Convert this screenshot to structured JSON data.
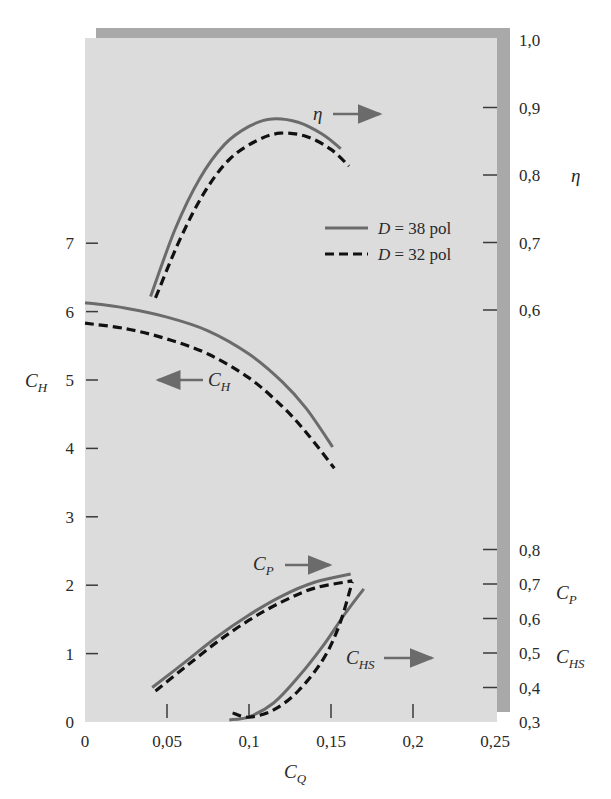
{
  "colors": {
    "page_background": "#ffffff",
    "plot_background": "#dcdcdc",
    "frame_bar": "#a9a9a9",
    "solid_series": "#6b6b6b",
    "dashed_series": "#111111",
    "tick": "#3a3a3a",
    "text": "#2a2a2a"
  },
  "labels": {
    "xlabel": {
      "main": "C",
      "sub": "Q"
    },
    "ylabel_left": {
      "main": "C",
      "sub": "H"
    },
    "ylabel_right_eta": "η",
    "ylabel_right_cp": {
      "main": "C",
      "sub": "P"
    },
    "ylabel_right_chs": {
      "main": "C",
      "sub": "HS"
    },
    "annot_eta": "η",
    "annot_ch": {
      "main": "C",
      "sub": "H"
    },
    "annot_cp": {
      "main": "C",
      "sub": "P"
    },
    "annot_chs": {
      "main": "C",
      "sub": "HS"
    }
  },
  "legend": [
    {
      "style": "solid",
      "label_var": "D",
      "label_rest": " = 38 pol"
    },
    {
      "style": "dashed",
      "label_var": "D",
      "label_rest": " = 32 pol"
    }
  ],
  "chart_data": {
    "type": "line",
    "title": "",
    "xlabel": "C_Q",
    "ylabel": "C_H",
    "x_ticks": [
      "0",
      "0,05",
      "0,1",
      "0,15",
      "0,2",
      "0,25"
    ],
    "x_tick_values": [
      0,
      0.05,
      0.1,
      0.15,
      0.2,
      0.25
    ],
    "xlim": [
      0,
      0.25
    ],
    "axes": {
      "left_CH": {
        "label": "C_H",
        "ylim": [
          0,
          8
        ],
        "ticks": [
          "0",
          "1",
          "2",
          "3",
          "4",
          "5",
          "6",
          "7"
        ],
        "tick_values": [
          0,
          1,
          2,
          3,
          4,
          5,
          6,
          7
        ]
      },
      "right_eta": {
        "label": "η",
        "ylim": [
          0.6,
          1.0
        ],
        "ticks": [
          "0,6",
          "0,7",
          "0,8",
          "0,9",
          "1,0"
        ],
        "tick_values": [
          0.6,
          0.7,
          0.8,
          0.9,
          1.0
        ]
      },
      "right_CP_CHS": {
        "label": "C_P, C_HS",
        "ylim": [
          0.3,
          0.8
        ],
        "ticks": [
          "0,3",
          "0,4",
          "0,5",
          "0,6",
          "0,7",
          "0,8"
        ],
        "tick_values": [
          0.3,
          0.4,
          0.5,
          0.6,
          0.7,
          0.8
        ]
      }
    },
    "grid": false,
    "legend_position": "upper right inside",
    "series": [
      {
        "name": "η, D = 38 pol",
        "axis": "right_eta",
        "style": "solid",
        "x": [
          0.04,
          0.055,
          0.07,
          0.085,
          0.1,
          0.114,
          0.13,
          0.145,
          0.156
        ],
        "y": [
          0.62,
          0.72,
          0.795,
          0.845,
          0.872,
          0.883,
          0.878,
          0.86,
          0.839
        ]
      },
      {
        "name": "η, D = 32 pol",
        "axis": "right_eta",
        "style": "dashed",
        "x": [
          0.043,
          0.058,
          0.073,
          0.088,
          0.104,
          0.119,
          0.135,
          0.15,
          0.161
        ],
        "y": [
          0.618,
          0.705,
          0.775,
          0.823,
          0.85,
          0.862,
          0.857,
          0.838,
          0.813
        ]
      },
      {
        "name": "C_H, D = 38 pol",
        "axis": "left_CH",
        "style": "solid",
        "x": [
          0.0,
          0.025,
          0.05,
          0.075,
          0.1,
          0.12,
          0.135,
          0.151
        ],
        "y": [
          6.13,
          6.05,
          5.92,
          5.72,
          5.38,
          4.98,
          4.58,
          4.02
        ]
      },
      {
        "name": "C_H, D = 32 pol",
        "axis": "left_CH",
        "style": "dashed",
        "x": [
          0.0,
          0.025,
          0.05,
          0.075,
          0.1,
          0.12,
          0.135,
          0.152
        ],
        "y": [
          5.83,
          5.75,
          5.6,
          5.38,
          5.03,
          4.62,
          4.23,
          3.71
        ]
      },
      {
        "name": "C_P, D = 38 pol",
        "axis": "right_CP_CHS",
        "style": "solid",
        "x": [
          0.041,
          0.06,
          0.08,
          0.1,
          0.12,
          0.14,
          0.162
        ],
        "y": [
          0.4,
          0.47,
          0.545,
          0.61,
          0.665,
          0.705,
          0.729
        ]
      },
      {
        "name": "C_P, D = 32 pol",
        "axis": "right_CP_CHS",
        "style": "dashed",
        "x": [
          0.043,
          0.06,
          0.08,
          0.1,
          0.12,
          0.14,
          0.163
        ],
        "y": [
          0.39,
          0.455,
          0.53,
          0.595,
          0.648,
          0.688,
          0.709
        ]
      },
      {
        "name": "C_HS, D = 38 pol",
        "axis": "right_CP_CHS",
        "style": "solid",
        "x": [
          0.088,
          0.1,
          0.115,
          0.13,
          0.145,
          0.158,
          0.17
        ],
        "y": [
          0.306,
          0.315,
          0.355,
          0.43,
          0.52,
          0.61,
          0.686
        ]
      },
      {
        "name": "C_HS, D = 32 pol",
        "axis": "right_CP_CHS",
        "style": "dashed",
        "x": [
          0.09,
          0.1,
          0.115,
          0.13,
          0.145,
          0.155,
          0.163
        ],
        "y": [
          0.326,
          0.314,
          0.335,
          0.39,
          0.48,
          0.58,
          0.706
        ]
      }
    ],
    "annotations": [
      {
        "text": "η →",
        "meaning": "η curves read on right η axis"
      },
      {
        "text": "← C_H",
        "meaning": "C_H curves read on left axis"
      },
      {
        "text": "C_P →",
        "meaning": "C_P curves read on right lower axis"
      },
      {
        "text": "C_HS →",
        "meaning": "C_HS curves read on right lower axis"
      }
    ]
  }
}
